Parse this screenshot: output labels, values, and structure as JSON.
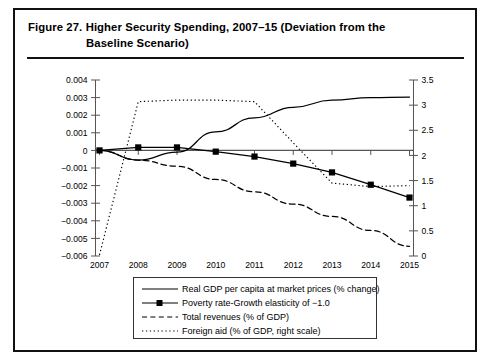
{
  "figure": {
    "label": "Figure 27.",
    "title_line1": "Higher Security Spending, 2007–15 (Deviation from the",
    "title_line2": "Baseline Scenario)"
  },
  "legend": {
    "items": [
      {
        "key": "solid-line",
        "label": "Real GDP per capita at market prices (% change)"
      },
      {
        "key": "solid-line-square-marker",
        "label": "Poverty rate-Growth elasticity of −1.0"
      },
      {
        "key": "dashed-line",
        "label": "Total revenues (% of GDP)"
      },
      {
        "key": "dotted-line",
        "label": "Foreign aid (% of GDP, right scale)"
      }
    ]
  },
  "chart_data": {
    "type": "line",
    "title": "Higher Security Spending, 2007–15 (Deviation from the Baseline Scenario)",
    "xlabel": "",
    "ylabel": "",
    "grid": false,
    "legend_position": "bottom",
    "categories": [
      "2007",
      "2008",
      "2009",
      "2010",
      "2011",
      "2012",
      "2013",
      "2014",
      "2015"
    ],
    "x": [
      2007,
      2008,
      2009,
      2010,
      2011,
      2012,
      2013,
      2014,
      2015
    ],
    "yticks_left": [
      0.004,
      0.003,
      0.002,
      0.001,
      0,
      -0.001,
      -0.002,
      -0.003,
      -0.004,
      -0.005,
      -0.006
    ],
    "ytick_labels_left": [
      "0.004",
      "0.003",
      "0.002",
      "0.001",
      "0",
      "−0.001",
      "−0.002",
      "−0.003",
      "−0.004",
      "−0.005",
      "−0.006"
    ],
    "ylim_left": [
      -0.006,
      0.004
    ],
    "yticks_right": [
      3.5,
      3,
      2.5,
      2,
      1.5,
      1,
      0.5,
      0
    ],
    "ytick_labels_right": [
      "3.5",
      "3",
      "2.5",
      "2",
      "1.5",
      "1",
      "0.5",
      "0"
    ],
    "ylim_right": [
      0,
      3.5
    ],
    "series": [
      {
        "name": "Real GDP per capita at market prices (% change)",
        "axis": "left",
        "style": "solid",
        "marker": "none",
        "values": [
          0,
          -0.00055,
          -0.0001,
          0.00105,
          0.00185,
          0.00245,
          0.00285,
          0.003,
          0.00303
        ]
      },
      {
        "name": "Poverty rate-Growth elasticity of −1.0",
        "axis": "left",
        "style": "solid",
        "marker": "square",
        "values": [
          0,
          0.00017,
          0.00017,
          -7e-05,
          -0.00035,
          -0.00075,
          -0.00125,
          -0.00195,
          -0.00268
        ]
      },
      {
        "name": "Total revenues (% of GDP)",
        "axis": "left",
        "style": "dashed",
        "marker": "none",
        "values": [
          0,
          -0.00055,
          -0.0009,
          -0.00165,
          -0.00235,
          -0.00305,
          -0.00375,
          -0.00455,
          -0.00545
        ]
      },
      {
        "name": "Foreign aid (% of GDP, right scale)",
        "axis": "right",
        "style": "dotted",
        "marker": "none",
        "values": [
          0.02,
          3.07,
          3.1,
          3.1,
          3.07,
          2.25,
          1.45,
          1.38,
          1.4
        ]
      }
    ]
  }
}
